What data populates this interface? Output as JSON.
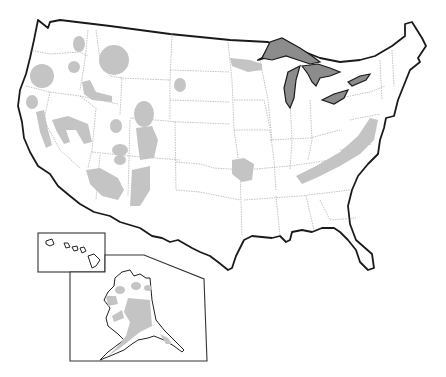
{
  "map": {
    "subject": "United States map with shaded regions",
    "colors": {
      "land": "#ffffff",
      "shaded_region": "#c4c4c4",
      "great_lakes": "#8c8c8c",
      "outline": "#1a1a1a",
      "state_borders": "#9a9a9a"
    },
    "insets": [
      "Hawaii",
      "Alaska"
    ],
    "shaded_areas": [
      "Cascades (Washington)",
      "Oregon Cascades",
      "Northern Rockies (Idaho/Montana)",
      "Snake River area (Idaho)",
      "Black Hills",
      "Sierra Nevada / California",
      "Nevada ranges",
      "Wasatch / Utah",
      "Colorado Rockies",
      "Wyoming ranges",
      "Arizona/New Mexico uplands",
      "Ozarks",
      "Appalachians",
      "Upper Peninsula / northern Wisconsin",
      "Alaska interior"
    ]
  }
}
